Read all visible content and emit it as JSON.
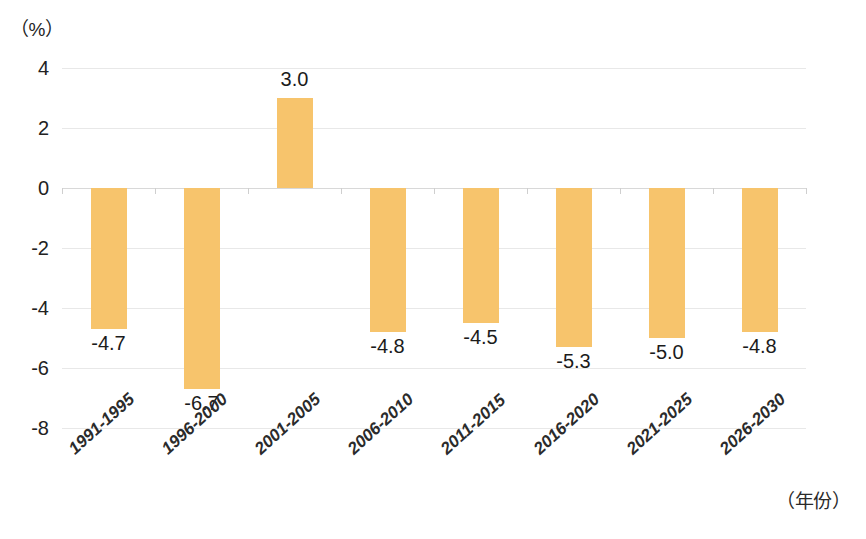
{
  "chart_data": {
    "type": "bar",
    "title": "",
    "subtitle": "",
    "xlabel": "（年份）",
    "ylabel": "（%）",
    "categories": [
      "1991-1995",
      "1996-2000",
      "2001-2005",
      "2006-2010",
      "2011-2015",
      "2016-2020",
      "2021-2025",
      "2026-2030"
    ],
    "values": [
      -4.7,
      -6.7,
      3.0,
      -4.8,
      -4.5,
      -5.3,
      -5.0,
      -4.8
    ],
    "data_labels": [
      "-4.7",
      "-6.7",
      "3.0",
      "-4.8",
      "-4.5",
      "-5.3",
      "-5.0",
      "-4.8"
    ],
    "ylim": [
      -8,
      4
    ],
    "yticks": [
      4,
      2,
      0,
      -2,
      -4,
      -6,
      -8
    ],
    "ytick_labels": [
      "4",
      "2",
      "0",
      "-2",
      "-4",
      "-6",
      "-8"
    ],
    "grid": true,
    "legend": "none",
    "bar_color": "#f7c46c",
    "gridline_color": "#e8e8e8",
    "zero_line_color": "#d8d8d8",
    "text_color": "#1b1b1b"
  }
}
